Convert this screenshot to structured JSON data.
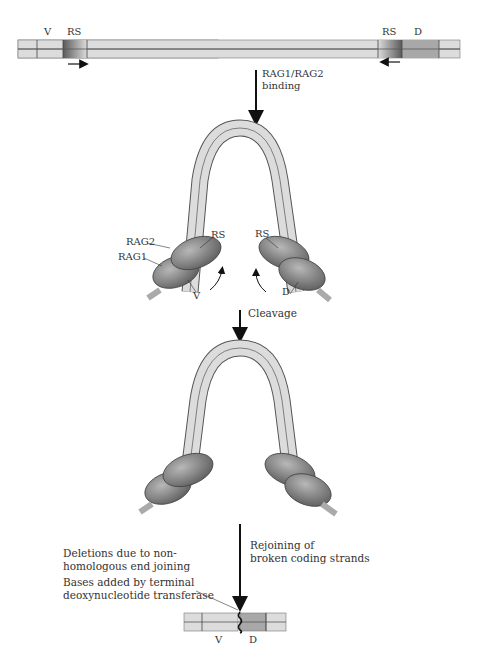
{
  "top_dna": {
    "segment_v": "V",
    "segment_rs_left": "RS",
    "segment_rs_right": "RS",
    "segment_d": "D"
  },
  "step1": {
    "label_line1": "RAG1/RAG2",
    "label_line2": "binding"
  },
  "hairpin1": {
    "label_rag2": "RAG2",
    "label_rag1": "RAG1",
    "label_rs_left": "RS",
    "label_rs_right": "RS",
    "label_v": "V",
    "label_d": "D"
  },
  "step2": {
    "label": "Cleavage"
  },
  "step3": {
    "label_line1": "Rejoining of",
    "label_line2": "broken coding strands"
  },
  "notes": {
    "deletions_line1": "Deletions due to non-",
    "deletions_line2": "homologous end joining",
    "bases_line1": "Bases added by terminal",
    "bases_line2": "deoxynucleotide transferase"
  },
  "bottom_dna": {
    "segment_v": "V",
    "segment_d": "D"
  },
  "colors": {
    "strand_fill": "#dcdcdc",
    "strand_outline": "#555555",
    "d_segment": "#a8a8a8",
    "rs_dark": "#6e6e6e",
    "rag_protein": "#8a8a8a",
    "arrow": "#111111"
  }
}
